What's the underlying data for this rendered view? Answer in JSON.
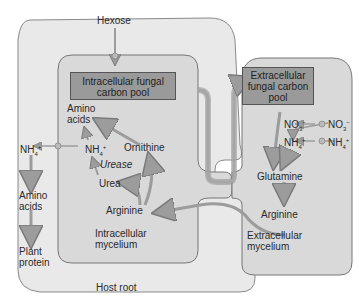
{
  "diagram": {
    "regions": {
      "host_root": "Host root",
      "intracellular_mycelium": [
        "Intracellular",
        "mycelium"
      ],
      "extracellular_mycelium": [
        "Extracellular",
        "mycelium"
      ]
    },
    "boxes": {
      "intracellular_pool": [
        "Intracellular fungal",
        "carbon pool"
      ],
      "extracellular_pool": [
        "Extracellular",
        "fungal carbon",
        "pool"
      ]
    },
    "labels": {
      "hexose": "Hexose",
      "amino_acids_intra": [
        "Amino",
        "acids"
      ],
      "nh4_intra": "NH",
      "urease": "Urease",
      "urea": "Urea",
      "ornithine": "Ornithine",
      "arginine_intra": "Arginine",
      "nh4_host": "NH",
      "amino_acids_host": [
        "Amino",
        "acids"
      ],
      "plant_protein": [
        "Plant",
        "protein"
      ],
      "no3_inner": "NO",
      "no3_outer": "NO",
      "nh4_extra_inner": "NH",
      "nh4_extra_outer": "NH",
      "glutamine": "Glutamine",
      "arginine_extra": "Arginine"
    },
    "chem": {
      "nh4_sub": "4",
      "nh4_sup": "+",
      "no3_sub": "3",
      "no3_sup": "−"
    },
    "colors": {
      "host_fill": "#e9e9e9",
      "mycelium_fill": "#d6d6d6",
      "box_fill": "#9a9a9a",
      "arrow": "#9c9c9c",
      "outline": "#6f6f6f"
    }
  }
}
